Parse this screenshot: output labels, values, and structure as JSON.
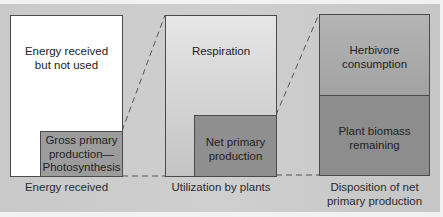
{
  "diagram": {
    "panels": [
      {
        "caption": "Energy received",
        "outer_label": "Energy received but not used",
        "inner_label": "Gross primary production—Photosynthesis",
        "outer_lines": [
          "Energy received",
          "but not used"
        ],
        "inner_lines": [
          "Gross primary",
          "production—",
          "Photosynthesis"
        ]
      },
      {
        "caption": "Utilization by plants",
        "outer_label": "Respiration",
        "inner_lines": [
          "Net primary",
          "production"
        ]
      },
      {
        "caption_lines": [
          "Disposition of net",
          "primary production"
        ],
        "top_label_lines": [
          "Herbivore",
          "consumption"
        ],
        "bottom_label_lines": [
          "Plant biomass",
          "remaining"
        ]
      }
    ],
    "colors": {
      "background": "#cbcbcb",
      "outer_box_1": "#ffffff",
      "inner_box_1": "#9a9a9a",
      "outer_box_2": "#dcdcdc",
      "inner_box_2": "#8e8e8e",
      "top_box_3": "#a9a9a9",
      "bottom_box_3": "#8c8c8c",
      "connector": "#555555"
    }
  }
}
